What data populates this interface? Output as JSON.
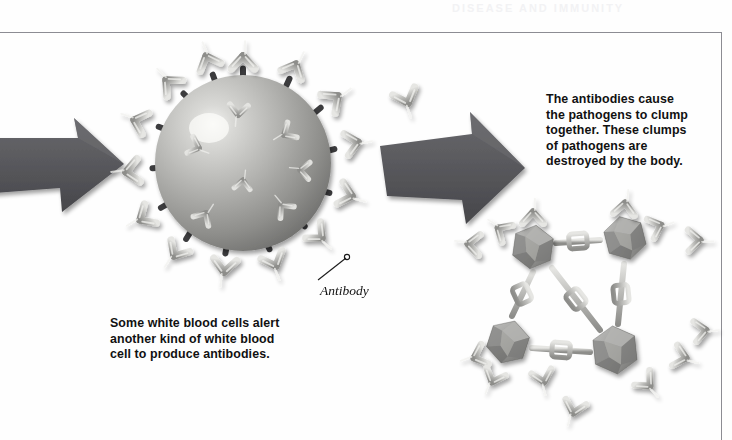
{
  "figure": {
    "background": "#fefefe",
    "border_color": "#8c8c93",
    "ghost_text": "DISEASE AND IMMUNITY"
  },
  "captions": {
    "left": "Some white blood cells alert\nanother kind of white blood\ncell to produce antibodies.",
    "right": "The antibodies cause\nthe pathogens to clump\ntogether. These clumps\nof pathogens are\ndestroyed by the body."
  },
  "labels": {
    "antibody": "Antibody"
  },
  "arrows": [
    {
      "name": "arrow-left",
      "fill": "#5a5a5e"
    },
    {
      "name": "arrow-middle",
      "fill": "#5a5a5e"
    }
  ],
  "colors": {
    "arrow": "#5a5a5e",
    "antibody_light": "#d8d8d6",
    "antibody_mid": "#a9a9a6",
    "antibody_dark": "#7c7c7a",
    "pathogen_light": "#c9c9c7",
    "pathogen_mid": "#9b9b99",
    "pathogen_dark": "#6e6e6c",
    "receptor": "#3a3a3c",
    "text": "#111111"
  },
  "scene": {
    "sphere": {
      "name": "pathogen-sphere",
      "cx": 243,
      "cy": 163,
      "r": 88
    },
    "clump": {
      "name": "pathogen-clump",
      "pathogens": [
        {
          "cx": 533,
          "cy": 247,
          "r": 24
        },
        {
          "cx": 625,
          "cy": 238,
          "r": 24
        },
        {
          "cx": 508,
          "cy": 342,
          "r": 24
        },
        {
          "cx": 615,
          "cy": 350,
          "r": 26
        }
      ]
    },
    "free_antibodies": [
      {
        "x": 408,
        "y": 103,
        "rot": -20
      },
      {
        "x": 573,
        "y": 413,
        "rot": 15
      },
      {
        "x": 463,
        "y": 247,
        "rot": -95
      },
      {
        "x": 700,
        "y": 240,
        "rot": 80
      },
      {
        "x": 706,
        "y": 330,
        "rot": 110
      }
    ]
  }
}
